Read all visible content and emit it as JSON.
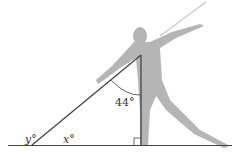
{
  "diagram": {
    "labels": {
      "angle_top": "44°",
      "angle_x": "x°",
      "angle_y": "y°"
    },
    "colors": {
      "line": "#444444",
      "silhouette": "#b5b5b5",
      "javelin": "#cccccc",
      "background": "#ffffff"
    }
  }
}
